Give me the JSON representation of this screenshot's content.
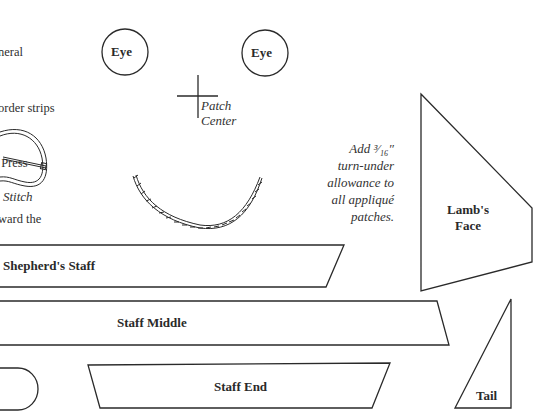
{
  "intro_text": {
    "lines": [
      "neral",
      "order strips",
      " Press",
      "ward the"
    ]
  },
  "labels": {
    "eye_left": "Eye",
    "eye_right": "Eye",
    "patch_center_line1": "Patch",
    "patch_center_line2": "Center",
    "stitch": "Stitch",
    "lambs_face_line1": "Lamb's",
    "lambs_face_line2": "Face",
    "shepherds_staff": "Shepherd's Staff",
    "staff_middle": "Staff Middle",
    "staff_end": "Staff End",
    "tail": "Tail"
  },
  "note": {
    "lines": [
      "Add ³⁄₁₆″",
      "turn-under",
      "allowance to",
      "all appliqué",
      "patches."
    ]
  },
  "colors": {
    "stroke": "#2a2a2a",
    "background": "#ffffff"
  }
}
